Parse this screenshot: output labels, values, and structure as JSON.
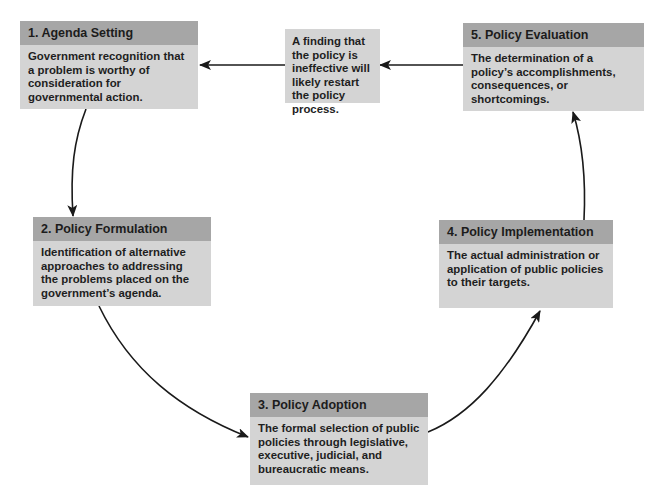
{
  "stages": [
    {
      "number": "1",
      "header": "1. Agenda Setting",
      "description": "Government recognition that a problem is worthy of consideration for governmental action."
    },
    {
      "number": "2",
      "header": "2. Policy Formulation",
      "description": "Identification of alternative approaches to addressing the problems placed on the government’s agenda."
    },
    {
      "number": "3",
      "header": "3. Policy Adoption",
      "description": "The formal selection of public policies through legislative, executive, judicial, and bureaucratic means."
    },
    {
      "number": "4",
      "header": "4. Policy Implementation",
      "description": "The actual administration or application of public policies to their targets."
    },
    {
      "number": "5",
      "header": "5. Policy Evaluation",
      "description": "The determination of a policy’s accomplishments, consequences, or shortcomings."
    }
  ],
  "feedback_note": "A finding that the policy is ineffective will likely restart the policy process.",
  "flow": [
    {
      "from": "1. Agenda Setting",
      "to": "2. Policy Formulation"
    },
    {
      "from": "2. Policy Formulation",
      "to": "3. Policy Adoption"
    },
    {
      "from": "3. Policy Adoption",
      "to": "4. Policy Implementation"
    },
    {
      "from": "4. Policy Implementation",
      "to": "5. Policy Evaluation"
    },
    {
      "from": "5. Policy Evaluation",
      "to": "feedback note"
    },
    {
      "from": "feedback note",
      "to": "1. Agenda Setting"
    }
  ],
  "colors": {
    "header_bg": "#a6a6a6",
    "body_bg": "#d4d4d4",
    "text": "#1e1e1e",
    "arrow": "#1a1a1a",
    "background": "#ffffff"
  }
}
